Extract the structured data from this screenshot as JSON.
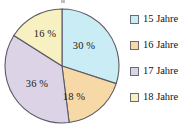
{
  "chart_data": {
    "type": "pie",
    "title": "",
    "subtitle": "",
    "xlabel": "",
    "ylabel": "",
    "categories": [
      "15 Jahre",
      "16 Jahre",
      "17 Jahre",
      "18 Jahre"
    ],
    "values": [
      30,
      18,
      36,
      16
    ],
    "unit": "%",
    "start_angle_deg": 0,
    "direction": "clockwise",
    "legend_position": "right",
    "grid": false,
    "slices": [
      {
        "category": "15 Jahre",
        "value": 30,
        "label": "30 %",
        "color": "#c9ecf5",
        "stroke": "#5a5a66",
        "start_deg": 0,
        "end_deg": 108
      },
      {
        "category": "16 Jahre",
        "value": 18,
        "label": "18 %",
        "color": "#f7d9a8",
        "stroke": "#5a5a66",
        "start_deg": 108,
        "end_deg": 172.8
      },
      {
        "category": "17 Jahre",
        "value": 36,
        "label": "36 %",
        "color": "#ddd3e6",
        "stroke": "#5a5a66",
        "start_deg": 172.8,
        "end_deg": 302.4
      },
      {
        "category": "18 Jahre",
        "value": 16,
        "label": "16 %",
        "color": "#f7f1c2",
        "stroke": "#5a5a66",
        "start_deg": 302.4,
        "end_deg": 360
      }
    ]
  },
  "legend": {
    "items": [
      {
        "label": "15 Jahre",
        "color": "#c9ecf5"
      },
      {
        "label": "16 Jahre",
        "color": "#f7d9a8"
      },
      {
        "label": "17 Jahre",
        "color": "#ddd3e6"
      },
      {
        "label": "18 Jahre",
        "color": "#f7f1c2"
      }
    ]
  }
}
